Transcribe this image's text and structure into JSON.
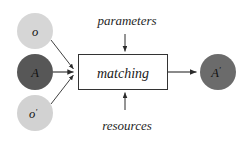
{
  "diagram": {
    "type": "flow-diagram",
    "background_color": "#ffffff",
    "nodes": [
      {
        "id": "o",
        "label": "o",
        "shape": "circle",
        "fill": "#d6d6d6",
        "cx": 35,
        "cy": 31,
        "r": 18
      },
      {
        "id": "A",
        "label": "A",
        "shape": "circle",
        "fill": "#575757",
        "cx": 35,
        "cy": 72,
        "r": 18
      },
      {
        "id": "o-prime",
        "label": "o",
        "label_prime": "′",
        "shape": "circle",
        "fill": "#d2d2d2",
        "cx": 35,
        "cy": 113,
        "r": 18
      },
      {
        "id": "A-prime",
        "label": "A",
        "label_prime": "′",
        "shape": "circle",
        "fill": "#6b6b6b",
        "cx": 218,
        "cy": 72,
        "r": 18
      }
    ],
    "process_box": {
      "id": "matching",
      "label": "matching",
      "shape": "rectangle",
      "fill": "#ffffff",
      "stroke": "#333333",
      "x": 78,
      "y": 54,
      "width": 90,
      "height": 36
    },
    "side_inputs": [
      {
        "id": "parameters",
        "label": "parameters",
        "position": "top",
        "arrow_direction": "down"
      },
      {
        "id": "resources",
        "label": "resources",
        "position": "bottom",
        "arrow_direction": "up"
      }
    ],
    "edges": [
      {
        "id": "edge-o-to-matching",
        "from": "o",
        "to": "matching"
      },
      {
        "id": "edge-A-to-matching",
        "from": "A",
        "to": "matching"
      },
      {
        "id": "edge-o-prime-to-matching",
        "from": "o-prime",
        "to": "matching"
      },
      {
        "id": "edge-parameters-to-matching",
        "from": "parameters",
        "to": "matching"
      },
      {
        "id": "edge-resources-to-matching",
        "from": "resources",
        "to": "matching"
      },
      {
        "id": "edge-matching-to-A-prime",
        "from": "matching",
        "to": "A-prime"
      }
    ],
    "edge_color": "#2b2b2b"
  }
}
